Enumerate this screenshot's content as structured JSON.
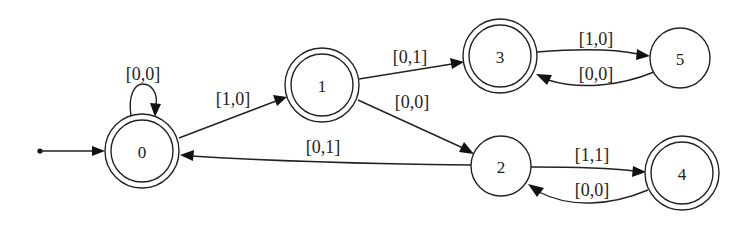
{
  "diagram": {
    "type": "finite-state-automaton",
    "start_state": "0",
    "nodes": [
      {
        "id": "0",
        "label": "0",
        "accepting": true,
        "cx": 142,
        "cy": 151,
        "r": 37
      },
      {
        "id": "1",
        "label": "1",
        "accepting": true,
        "cx": 322,
        "cy": 85,
        "r": 37
      },
      {
        "id": "2",
        "label": "2",
        "accepting": false,
        "cx": 501,
        "cy": 166,
        "r": 30
      },
      {
        "id": "3",
        "label": "3",
        "accepting": true,
        "cx": 500,
        "cy": 56,
        "r": 37
      },
      {
        "id": "4",
        "label": "4",
        "accepting": true,
        "cx": 682,
        "cy": 173,
        "r": 37
      },
      {
        "id": "5",
        "label": "5",
        "accepting": false,
        "cx": 680,
        "cy": 58,
        "r": 30
      }
    ],
    "edges": [
      {
        "from": "start",
        "to": "0",
        "label": ""
      },
      {
        "from": "0",
        "to": "0",
        "label": "[0,0]"
      },
      {
        "from": "0",
        "to": "1",
        "label": "[1,0]"
      },
      {
        "from": "1",
        "to": "3",
        "label": "[0,1]"
      },
      {
        "from": "1",
        "to": "2",
        "label": "[0,0]"
      },
      {
        "from": "2",
        "to": "0",
        "label": "[0,1]"
      },
      {
        "from": "3",
        "to": "5",
        "label": "[1,0]"
      },
      {
        "from": "5",
        "to": "3",
        "label": "[0,0]"
      },
      {
        "from": "2",
        "to": "4",
        "label": "[1,1]"
      },
      {
        "from": "4",
        "to": "2",
        "label": "[0,0]"
      }
    ]
  },
  "labels": {
    "n0": "0",
    "n1": "1",
    "n2": "2",
    "n3": "3",
    "n4": "4",
    "n5": "5",
    "e_0_0": "[0,0]",
    "e_0_1": "[1,0]",
    "e_1_3": "[0,1]",
    "e_1_2": "[0,0]",
    "e_2_0": "[0,1]",
    "e_3_5": "[1,0]",
    "e_5_3": "[0,0]",
    "e_2_4": "[1,1]",
    "e_4_2": "[0,0]"
  },
  "colors": {
    "stroke": "#222222",
    "background": "#ffffff"
  }
}
